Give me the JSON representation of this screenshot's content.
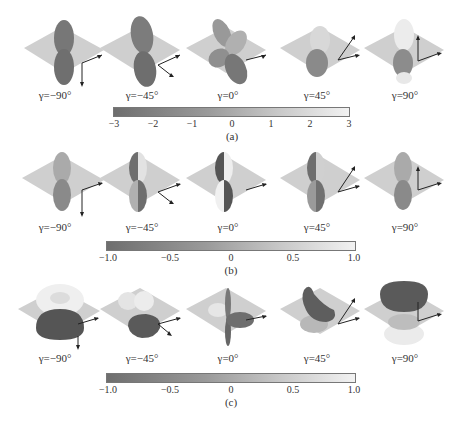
{
  "panels": [
    {
      "id": "a",
      "label": "(a)",
      "gamma_labels": [
        "γ=−90°",
        "γ=−45°",
        "γ=0°",
        "γ=45°",
        "γ=90°"
      ],
      "colorbar": {
        "min": -3,
        "max": 3,
        "ticks": [
          "−3",
          "−2",
          "−1",
          "0",
          "1",
          "2",
          "3"
        ]
      }
    },
    {
      "id": "b",
      "label": "(b)",
      "gamma_labels": [
        "γ=−90°",
        "γ=−45°",
        "γ=0°",
        "γ=45°",
        "γ=90°"
      ],
      "colorbar": {
        "min": -1.0,
        "max": 1.0,
        "ticks": [
          "−1.0",
          "−0.5",
          "0",
          "0.5",
          "1.0"
        ]
      }
    },
    {
      "id": "c",
      "label": "(c)",
      "gamma_labels": [
        "γ=−90°",
        "γ=−45°",
        "γ=0°",
        "γ=45°",
        "γ=90°"
      ],
      "colorbar": {
        "min": -1.0,
        "max": 1.0,
        "ticks": [
          "−1.0",
          "−0.5",
          "0",
          "0.5",
          "1.0"
        ]
      }
    }
  ],
  "colors": {
    "plane": "#cfcfcf",
    "lobe_dark": "#6a6a6a",
    "lobe_mid": "#8c8c8c",
    "lobe_light": "#e6e6e6",
    "arrow": "#222222"
  }
}
